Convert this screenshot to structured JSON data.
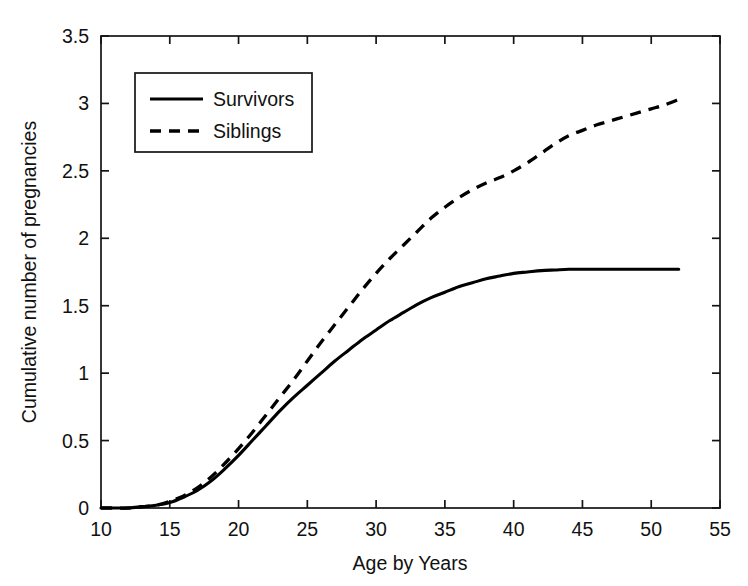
{
  "chart_data": {
    "type": "line",
    "title": "",
    "xlabel": "Age by Years",
    "ylabel": "Cumulative number of pregnancies",
    "xlim": [
      10,
      55
    ],
    "ylim": [
      0,
      3.5
    ],
    "xticks": [
      10,
      15,
      20,
      25,
      30,
      35,
      40,
      45,
      50,
      55
    ],
    "xtick_labels": [
      "10",
      "15",
      "20",
      "25",
      "30",
      "35",
      "40",
      "45",
      "50",
      "55"
    ],
    "yticks": [
      0,
      0.5,
      1,
      1.5,
      2,
      2.5,
      3,
      3.5
    ],
    "ytick_labels": [
      "0",
      "0.5",
      "1",
      "1.5",
      "2",
      "2.5",
      "3",
      "3.5"
    ],
    "grid": false,
    "frame": "box",
    "legend_position": "upper-left",
    "x": [
      10,
      11,
      12,
      13,
      14,
      15,
      16,
      17,
      18,
      19,
      20,
      21,
      22,
      23,
      24,
      25,
      26,
      27,
      28,
      29,
      30,
      31,
      32,
      33,
      34,
      35,
      36,
      37,
      38,
      39,
      40,
      41,
      42,
      43,
      44,
      45,
      46,
      47,
      48,
      49,
      50,
      51,
      52
    ],
    "series": [
      {
        "name": "Survivors",
        "style": "solid",
        "color": "#000000",
        "values": [
          0,
          0,
          0,
          0.01,
          0.02,
          0.04,
          0.08,
          0.13,
          0.2,
          0.29,
          0.39,
          0.5,
          0.61,
          0.72,
          0.82,
          0.91,
          1.0,
          1.09,
          1.17,
          1.25,
          1.32,
          1.39,
          1.45,
          1.51,
          1.56,
          1.6,
          1.64,
          1.67,
          1.7,
          1.72,
          1.74,
          1.75,
          1.76,
          1.765,
          1.77,
          1.77,
          1.77,
          1.77,
          1.77,
          1.77,
          1.77,
          1.77,
          1.77
        ]
      },
      {
        "name": "Siblings",
        "style": "dashed",
        "color": "#000000",
        "values": [
          0,
          0,
          0,
          0.01,
          0.02,
          0.05,
          0.09,
          0.15,
          0.23,
          0.33,
          0.44,
          0.56,
          0.69,
          0.82,
          0.95,
          1.09,
          1.23,
          1.36,
          1.49,
          1.62,
          1.74,
          1.85,
          1.95,
          2.05,
          2.15,
          2.23,
          2.3,
          2.36,
          2.41,
          2.45,
          2.5,
          2.56,
          2.63,
          2.7,
          2.76,
          2.8,
          2.84,
          2.87,
          2.9,
          2.93,
          2.96,
          2.99,
          3.03
        ]
      }
    ]
  },
  "legend": {
    "entries": [
      {
        "label": "Survivors",
        "style": "solid"
      },
      {
        "label": "Siblings",
        "style": "dashed"
      }
    ]
  }
}
